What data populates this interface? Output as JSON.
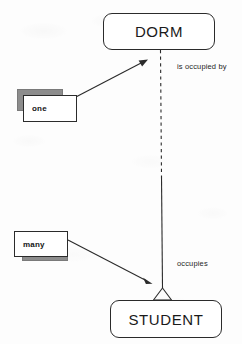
{
  "diagram": {
    "type": "entity-relationship-diagram",
    "notation": "crow's foot",
    "background_color": "#fdfdfd",
    "line_color": "#2b2b2b",
    "shadow_color": "#8d8d8d"
  },
  "entities": [
    {
      "id": "dorm",
      "label": "DORM"
    },
    {
      "id": "student",
      "label": "STUDENT"
    }
  ],
  "relationship_labels": [
    {
      "id": "occupied_by",
      "text": "is occupied by"
    },
    {
      "id": "occupies",
      "text": "occupies"
    }
  ],
  "cardinality_notes": [
    {
      "id": "one",
      "text": "one"
    },
    {
      "id": "many",
      "text": "many"
    }
  ]
}
